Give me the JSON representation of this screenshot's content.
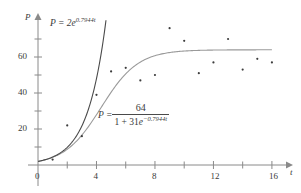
{
  "chart_data": {
    "type": "scatter",
    "title": "",
    "subtitle": "",
    "xlabel": "t",
    "ylabel": "P",
    "xlim": [
      -0.6,
      17.2
    ],
    "ylim": [
      -3,
      80
    ],
    "grid": false,
    "legend_position": "none",
    "x_ticks_major": [
      0,
      4,
      8,
      12,
      16
    ],
    "x_ticks_minor": [
      2,
      6,
      10,
      14
    ],
    "x_tick_labels": [
      "0",
      "4",
      "8",
      "12",
      "16"
    ],
    "y_ticks_major": [
      20,
      40,
      60
    ],
    "y_ticks_minor": [
      10,
      30,
      50,
      70
    ],
    "y_tick_labels": [
      "20",
      "40",
      "60"
    ],
    "series": [
      {
        "name": "observed data",
        "type": "scatter",
        "marker": "dot",
        "color": "#3d3d3d",
        "x": [
          1,
          2,
          3,
          4,
          5,
          6,
          7,
          8,
          9,
          10,
          11,
          12,
          13,
          14,
          15,
          16
        ],
        "values": [
          3,
          22,
          16,
          39,
          52,
          54,
          47,
          50,
          76,
          69,
          51,
          57,
          70,
          53,
          59,
          57
        ]
      },
      {
        "name": "exponential model",
        "type": "line",
        "color": "#4a4a4a",
        "formula_text": "P = 2e^(0.7944t)",
        "a": 2,
        "k": 0.7944,
        "t_range": [
          0,
          4.65
        ]
      },
      {
        "name": "logistic model",
        "type": "line",
        "color": "#9a9a9a",
        "formula_text": "P = 64 / (1 + 31e^(-0.7944t))",
        "carrying_capacity": 64,
        "a": 31,
        "k": 0.7944,
        "t_range": [
          0,
          16
        ]
      }
    ],
    "annotations": [
      {
        "name": "exponential-equation-label",
        "text": "P = 2e^0.7944t",
        "x": 1.0,
        "y": 72
      },
      {
        "name": "logistic-equation-label",
        "text": "P = 64 / (1 + 31e^-0.7944t)",
        "x": 4.5,
        "y": 30
      }
    ]
  },
  "axes": {
    "y_axis_name": "P",
    "x_axis_name": "t",
    "x_tick_labels": [
      "0",
      "4",
      "8",
      "12",
      "16"
    ],
    "y_tick_labels": [
      "20",
      "40",
      "60"
    ]
  },
  "equations": {
    "exponential": {
      "lhs": "P = 2",
      "base": "e",
      "exponent": "0.7944t"
    },
    "logistic": {
      "lhs": "P =",
      "numerator": "64",
      "denominator_pre": "1 + 31",
      "denominator_base": "e",
      "denominator_exponent": "−0.7944t"
    }
  },
  "colors": {
    "exp_curve": "#4a4a4a",
    "log_curve": "#9a9a9a",
    "points": "#3d3d3d",
    "axis": "#8a8a8a",
    "text": "#3a3a3a",
    "background": "#ffffff"
  }
}
